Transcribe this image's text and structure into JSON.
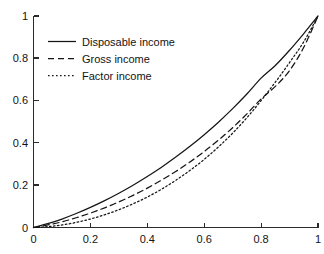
{
  "figure": {
    "title": "",
    "background_color": "#ffffff",
    "ink_color": "#151515"
  },
  "chart_data": {
    "type": "line",
    "title": "",
    "subtitle": "",
    "xlabel": "",
    "ylabel": "",
    "xlim": [
      0,
      1
    ],
    "ylim": [
      0,
      1
    ],
    "grid": false,
    "legend_position": "upper-left",
    "xticks": [
      0,
      0.2,
      0.4,
      0.6,
      0.8,
      1
    ],
    "xticklabels": [
      "0",
      "0.2",
      "0.4",
      "0.6",
      "0.8",
      "1"
    ],
    "yticks": [
      0,
      0.2,
      0.4,
      0.6,
      0.8,
      1
    ],
    "yticklabels": [
      "0",
      "0.2",
      "0.4",
      "0.6",
      "0.8",
      "1"
    ],
    "x": [
      0,
      0.05,
      0.1,
      0.15,
      0.2,
      0.25,
      0.3,
      0.35,
      0.4,
      0.45,
      0.5,
      0.55,
      0.6,
      0.65,
      0.7,
      0.75,
      0.8,
      0.85,
      0.9,
      0.95,
      1
    ],
    "series": [
      {
        "name": "Disposable income",
        "linestyle": "solid",
        "color": "#151515",
        "values": [
          0,
          0.018,
          0.04,
          0.066,
          0.095,
          0.127,
          0.162,
          0.2,
          0.241,
          0.285,
          0.333,
          0.384,
          0.439,
          0.498,
          0.562,
          0.631,
          0.706,
          0.766,
          0.838,
          0.917,
          1
        ]
      },
      {
        "name": "Gross income",
        "linestyle": "dashed",
        "color": "#151515",
        "values": [
          0,
          0.012,
          0.027,
          0.046,
          0.068,
          0.093,
          0.121,
          0.152,
          0.186,
          0.224,
          0.265,
          0.31,
          0.359,
          0.413,
          0.472,
          0.537,
          0.608,
          0.667,
          0.742,
          0.852,
          1
        ]
      },
      {
        "name": "Factor income",
        "linestyle": "dotted",
        "color": "#151515",
        "values": [
          0,
          0.004,
          0.012,
          0.024,
          0.04,
          0.06,
          0.084,
          0.112,
          0.144,
          0.181,
          0.223,
          0.27,
          0.322,
          0.381,
          0.446,
          0.519,
          0.6,
          0.687,
          0.78,
          0.878,
          1
        ]
      }
    ]
  },
  "legend": {
    "items": [
      {
        "label": "Disposable income",
        "linestyle": "solid"
      },
      {
        "label": "Gross income",
        "linestyle": "dashed"
      },
      {
        "label": "Factor income",
        "linestyle": "dotted"
      }
    ]
  }
}
